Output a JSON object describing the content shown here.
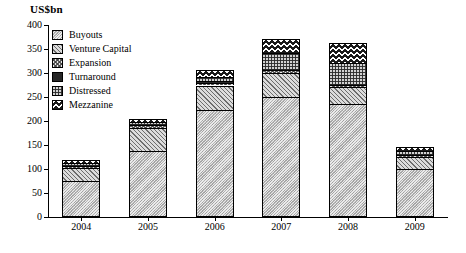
{
  "chart": {
    "title": "US$bn",
    "axis_label_y": "US$bn"
  },
  "legend": {
    "position": "top-left-inside",
    "items": [
      {
        "label": "Buyouts",
        "pattern": "solid-grey-hatch",
        "key": "buyouts"
      },
      {
        "label": "Venture Capital",
        "pattern": "diagonal-hatch",
        "key": "venture_capital"
      },
      {
        "label": "Expansion",
        "pattern": "cross-hatch-light",
        "key": "expansion"
      },
      {
        "label": "Turnaround",
        "pattern": "solid-black",
        "key": "turnaround"
      },
      {
        "label": "Distressed",
        "pattern": "grid-hatch",
        "key": "distressed"
      },
      {
        "label": "Mezzanine",
        "pattern": "wave-hatch",
        "key": "mezzanine"
      }
    ]
  },
  "yaxis": {
    "ticks": [
      "400",
      "350",
      "300",
      "250",
      "200",
      "150",
      "100",
      "50",
      "0"
    ],
    "min": 0,
    "max": 400,
    "step": 50
  },
  "xaxis": {
    "ticks": [
      "2004",
      "2005",
      "2006",
      "2007",
      "2008",
      "2009"
    ]
  },
  "chart_data": {
    "type": "bar",
    "subtype": "stacked",
    "title": "US$bn",
    "xlabel": "",
    "ylabel": "US$bn",
    "ylim": [
      0,
      400
    ],
    "ystep": 50,
    "grid": false,
    "legend_position": "top-left-inside",
    "categories": [
      "2004",
      "2005",
      "2006",
      "2007",
      "2008",
      "2009"
    ],
    "series": [
      {
        "name": "Buyouts",
        "values": [
          75,
          138,
          222,
          250,
          235,
          100
        ]
      },
      {
        "name": "Venture Capital",
        "values": [
          28,
          48,
          52,
          50,
          35,
          25
        ]
      },
      {
        "name": "Expansion",
        "values": [
          4,
          5,
          6,
          6,
          5,
          4
        ]
      },
      {
        "name": "Turnaround",
        "values": [
          2,
          2,
          3,
          3,
          3,
          2
        ]
      },
      {
        "name": "Distressed",
        "values": [
          3,
          4,
          9,
          32,
          43,
          6
        ]
      },
      {
        "name": "Mezzanine",
        "values": [
          6,
          8,
          15,
          29,
          42,
          8
        ]
      }
    ],
    "totals": [
      118,
      205,
      307,
      370,
      363,
      145
    ]
  }
}
